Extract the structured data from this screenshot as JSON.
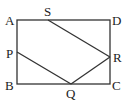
{
  "diagram": {
    "type": "geometry",
    "shape": "rectangle ABCD with inscribed segments",
    "points": {
      "A": {
        "label": "A",
        "x": 17,
        "y": 20
      },
      "D": {
        "label": "D",
        "x": 110,
        "y": 20
      },
      "B": {
        "label": "B",
        "x": 17,
        "y": 84
      },
      "C": {
        "label": "C",
        "x": 110,
        "y": 84
      },
      "S": {
        "label": "S",
        "x": 48,
        "y": 20
      },
      "P": {
        "label": "P",
        "x": 17,
        "y": 52
      },
      "Q": {
        "label": "Q",
        "x": 71,
        "y": 84
      },
      "R": {
        "label": "R",
        "x": 110,
        "y": 57
      }
    },
    "segments": [
      [
        "A",
        "D"
      ],
      [
        "D",
        "C"
      ],
      [
        "C",
        "B"
      ],
      [
        "B",
        "A"
      ],
      [
        "S",
        "R"
      ],
      [
        "P",
        "Q"
      ],
      [
        "Q",
        "R"
      ]
    ],
    "line_color": "#333333"
  }
}
